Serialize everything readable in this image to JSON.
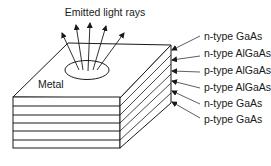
{
  "diagram": {
    "title": "Emitted light rays",
    "top_label": "Metal",
    "layers": [
      {
        "label": "n-type GaAs"
      },
      {
        "label": "n-type AlGaAs"
      },
      {
        "label": "p-type AlGaAs"
      },
      {
        "label": "p-type AlGaAs"
      },
      {
        "label": "n-type GaAs"
      },
      {
        "label": "p-type GaAs"
      }
    ],
    "colors": {
      "stroke": "#1a1a1a",
      "background": "#ffffff"
    }
  }
}
